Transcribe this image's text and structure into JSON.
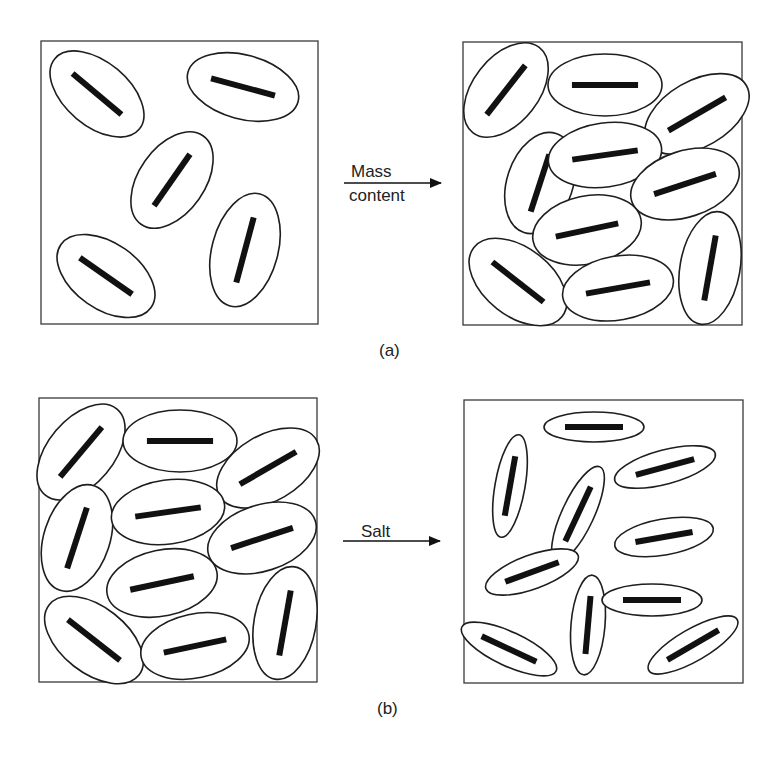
{
  "figure": {
    "panel_a": {
      "label": "(a)",
      "arrow_label_top": "Mass",
      "arrow_label_bottom": "content",
      "left_state": {
        "particle_count": 5,
        "description": "sparse, randomly oriented ellipsoidal particles with bar cores"
      },
      "right_state": {
        "particle_count": 11,
        "description": "densely packed ellipsoidal particles"
      }
    },
    "panel_b": {
      "label": "(b)",
      "arrow_label": "Salt",
      "left_state": {
        "particle_count": 11,
        "description": "densely packed ellipsoidal particles"
      },
      "right_state": {
        "particle_count": 11,
        "description": "shrunken, elongated particles, loosely distributed"
      }
    },
    "colors": {
      "line": "#1e1e1e",
      "bar": "#111111",
      "background": "#ffffff"
    }
  },
  "particles": {
    "a_left": [
      [
        97,
        94,
        55,
        32,
        40
      ],
      [
        243,
        87,
        57,
        32,
        15
      ],
      [
        172,
        180,
        54,
        33,
        -55
      ],
      [
        245,
        250,
        58,
        33,
        -75
      ],
      [
        106,
        276,
        55,
        33,
        35
      ]
    ],
    "a_right": [
      [
        506,
        90,
        54,
        33,
        -52
      ],
      [
        605,
        85,
        57,
        31,
        0
      ],
      [
        697,
        114,
        57,
        33,
        -30
      ],
      [
        540,
        183,
        52,
        33,
        -72
      ],
      [
        605,
        155,
        57,
        32,
        -8
      ],
      [
        685,
        184,
        56,
        33,
        -18
      ],
      [
        587,
        230,
        55,
        34,
        -12
      ],
      [
        518,
        282,
        56,
        34,
        38
      ],
      [
        618,
        288,
        56,
        32,
        -10
      ],
      [
        710,
        268,
        57,
        30,
        -80
      ]
    ],
    "b_left": [
      [
        81,
        452,
        56,
        33,
        -50
      ],
      [
        180,
        441,
        57,
        31,
        0
      ],
      [
        268,
        468,
        56,
        33,
        -30
      ],
      [
        77,
        538,
        55,
        33,
        -72
      ],
      [
        168,
        512,
        57,
        32,
        -8
      ],
      [
        262,
        538,
        56,
        33,
        -18
      ],
      [
        162,
        583,
        56,
        33,
        -12
      ],
      [
        94,
        640,
        57,
        33,
        38
      ],
      [
        195,
        646,
        55,
        32,
        -12
      ],
      [
        285,
        623,
        57,
        31,
        -80
      ]
    ],
    "b_right": [
      [
        594,
        427,
        50,
        15,
        0
      ],
      [
        510,
        486,
        52,
        15,
        -80
      ],
      [
        665,
        467,
        52,
        17,
        -15
      ],
      [
        578,
        514,
        52,
        16,
        -65
      ],
      [
        664,
        537,
        50,
        18,
        -10
      ],
      [
        532,
        572,
        49,
        17,
        -20
      ],
      [
        588,
        625,
        50,
        17,
        -85
      ],
      [
        652,
        600,
        50,
        16,
        0
      ],
      [
        509,
        649,
        52,
        17,
        25
      ],
      [
        693,
        645,
        51,
        16,
        -30
      ]
    ]
  }
}
